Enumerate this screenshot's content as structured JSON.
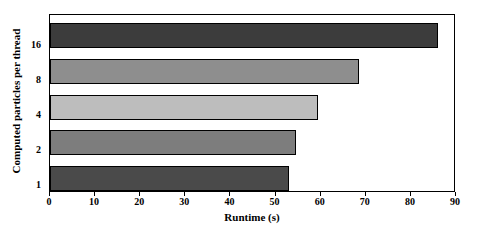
{
  "chart_data": {
    "type": "bar",
    "orientation": "horizontal",
    "title": "",
    "xlabel": "Runtime (s)",
    "ylabel": "Computed particles per thread",
    "categories": [
      "1",
      "2",
      "4",
      "8",
      "16"
    ],
    "values": [
      53,
      54.5,
      59.5,
      68.5,
      86
    ],
    "xlim": [
      0,
      90
    ],
    "xticks": [
      0,
      10,
      20,
      30,
      40,
      50,
      60,
      70,
      80,
      90
    ],
    "xtick_labels": [
      "0",
      "10",
      "20",
      "30",
      "40",
      "50",
      "60",
      "70",
      "80",
      "90"
    ],
    "grid": false,
    "legend": false,
    "bar_colors": [
      "#4a4a4a",
      "#7d7d7d",
      "#bdbdbd",
      "#8e8e8e",
      "#3c3c3c"
    ],
    "bar_edge_color": "#000000",
    "frame_color": "#000000",
    "background_color": "#ffffff",
    "bars": [
      {
        "category": "16",
        "value": 86,
        "color": "#3c3c3c"
      },
      {
        "category": "8",
        "value": 68.5,
        "color": "#8e8e8e"
      },
      {
        "category": "4",
        "value": 59.5,
        "color": "#bdbdbd"
      },
      {
        "category": "2",
        "value": 54.5,
        "color": "#7d7d7d"
      },
      {
        "category": "1",
        "value": 53,
        "color": "#4a4a4a"
      }
    ]
  }
}
